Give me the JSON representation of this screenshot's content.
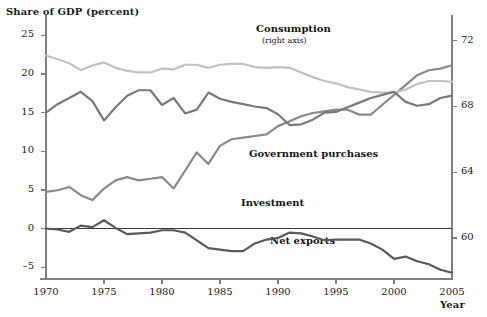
{
  "chart_data": {
    "type": "line",
    "title": "",
    "ylabel": "Share of GDP (percent)",
    "xlabel": "Year",
    "grid": false,
    "legend_position": "inline-annotations",
    "x": [
      1970,
      1971,
      1972,
      1973,
      1974,
      1975,
      1976,
      1977,
      1978,
      1979,
      1980,
      1981,
      1982,
      1983,
      1984,
      1985,
      1986,
      1987,
      1988,
      1989,
      1990,
      1991,
      1992,
      1993,
      1994,
      1995,
      1996,
      1997,
      1998,
      1999,
      2000,
      2001,
      2002,
      2003,
      2004,
      2005
    ],
    "xlim": [
      1970,
      2005
    ],
    "xticks": [
      1970,
      1975,
      1980,
      1985,
      1990,
      1995,
      2000,
      2005
    ],
    "left_axis": {
      "ylim": [
        -6.5,
        27.5
      ],
      "yticks": [
        -5,
        0,
        5,
        10,
        15,
        20,
        25
      ]
    },
    "right_axis": {
      "ylim": [
        57.5,
        73.5
      ],
      "yticks": [
        60,
        64,
        68,
        72
      ]
    },
    "series": [
      {
        "name": "Consumption",
        "sublabel": "(right axis)",
        "axis": "right",
        "color": "#8a8a8a",
        "values": [
          62.8,
          62.9,
          63.1,
          62.6,
          62.3,
          63.0,
          63.5,
          63.7,
          63.5,
          63.6,
          63.7,
          63.0,
          64.1,
          65.2,
          64.5,
          65.6,
          66.0,
          66.1,
          66.2,
          66.3,
          66.8,
          67.1,
          67.4,
          67.6,
          67.7,
          67.8,
          67.8,
          67.5,
          67.5,
          68.1,
          68.7,
          69.3,
          69.9,
          70.2,
          70.3,
          70.5
        ]
      },
      {
        "name": "Government purchases",
        "axis": "left",
        "color": "#c2c2c2",
        "values": [
          22.4,
          21.9,
          21.4,
          20.5,
          21.1,
          21.5,
          20.8,
          20.4,
          20.2,
          20.2,
          20.7,
          20.6,
          21.2,
          21.2,
          20.8,
          21.2,
          21.3,
          21.3,
          20.9,
          20.8,
          20.9,
          20.8,
          20.2,
          19.6,
          19.1,
          18.8,
          18.3,
          18.0,
          17.7,
          17.6,
          17.6,
          18.0,
          18.7,
          19.1,
          19.1,
          19.0
        ]
      },
      {
        "name": "Investment",
        "axis": "left",
        "color": "#7a7a7a",
        "values": [
          15.0,
          16.1,
          16.9,
          17.7,
          16.5,
          14.0,
          15.7,
          17.2,
          17.9,
          17.9,
          16.0,
          16.9,
          14.9,
          15.4,
          17.6,
          16.8,
          16.4,
          16.1,
          15.8,
          15.6,
          14.8,
          13.4,
          13.5,
          14.1,
          15.0,
          15.1,
          15.7,
          16.3,
          16.9,
          17.3,
          17.7,
          16.4,
          15.9,
          16.1,
          16.9,
          17.2
        ]
      },
      {
        "name": "Net exports",
        "axis": "left",
        "color": "#5a5a5a",
        "values": [
          0.0,
          -0.1,
          -0.4,
          0.4,
          0.2,
          1.1,
          0.1,
          -0.7,
          -0.6,
          -0.5,
          -0.2,
          -0.2,
          -0.5,
          -1.5,
          -2.5,
          -2.7,
          -2.9,
          -2.9,
          -1.9,
          -1.4,
          -1.2,
          -0.5,
          -0.6,
          -1.0,
          -1.5,
          -1.4,
          -1.4,
          -1.4,
          -1.9,
          -2.7,
          -3.9,
          -3.6,
          -4.2,
          -4.6,
          -5.3,
          -5.7
        ]
      }
    ],
    "annotations": [
      {
        "text": "Consumption",
        "subtext": "(right axis)"
      },
      {
        "text": "Government purchases"
      },
      {
        "text": "Investment"
      },
      {
        "text": "Net exports"
      }
    ]
  },
  "axis_titles": {
    "y": "Share of GDP (percent)",
    "x": "Year"
  },
  "colors": {
    "consumption": "#8a8a8a",
    "government": "#c2c2c2",
    "investment": "#7a7a7a",
    "net_exports": "#5a5a5a",
    "axis": "#808080",
    "text": "#1a1a1a"
  }
}
